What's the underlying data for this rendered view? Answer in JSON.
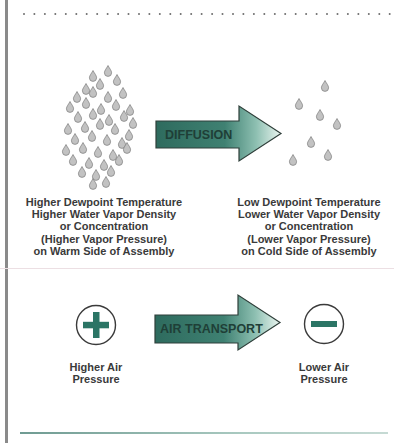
{
  "diagram": {
    "colors": {
      "arrow_dark": "#2e6b5e",
      "arrow_light": "#e6f3ee",
      "arrow_outline": "#2f3f3a",
      "droplet_fill": "#bdbdbd",
      "droplet_stroke": "#7d7d7d",
      "symbol_green": "#2b7565",
      "text": "#3a3a3a",
      "border": "#8a8a8a"
    },
    "diffusion": {
      "arrow_label": "DIFFUSION",
      "left_caption": [
        "Higher Dewpoint Temperature",
        "Higher Water Vapor Density",
        "or Concentration",
        "(Higher Vapor Pressure)",
        "on Warm Side of Assembly"
      ],
      "right_caption": [
        "Low Dewpoint Temperature",
        "Lower Water Vapor Density",
        "or Concentration",
        "(Lower Vapor Pressure)",
        "on Cold Side of Assembly"
      ],
      "left_icon": "dense-water-droplets-icon",
      "right_icon": "sparse-water-droplets-icon"
    },
    "air_transport": {
      "arrow_label": "AIR TRANSPORT",
      "left_symbol": "plus-circle-icon",
      "right_symbol": "minus-circle-icon",
      "left_caption": [
        "Higher Air",
        "Pressure"
      ],
      "right_caption": [
        "Lower Air",
        "Pressure"
      ]
    }
  }
}
